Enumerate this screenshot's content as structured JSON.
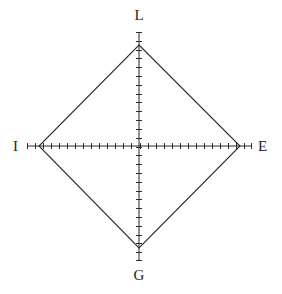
{
  "figure": {
    "name": "diamond-axes-plot",
    "background_color": "#ffffff",
    "line_color": "#2b2b2b",
    "label_color": "#1d1d1d"
  },
  "labels": {
    "top": "L",
    "right": "E",
    "bottom": "G",
    "left": "I"
  },
  "chart_data": {
    "type": "line",
    "title": "",
    "subtitle": "",
    "xlabel": "",
    "ylabel": "",
    "grid": false,
    "legend": "none",
    "axes": [
      {
        "name": "L",
        "direction": "up",
        "angle_deg": 90,
        "value": 1.0,
        "axis_length": 1.08
      },
      {
        "name": "E",
        "direction": "right",
        "angle_deg": 0,
        "value": 1.0,
        "axis_length": 1.12
      },
      {
        "name": "G",
        "direction": "down",
        "angle_deg": 270,
        "value": 1.0,
        "axis_length": 1.08
      },
      {
        "name": "I",
        "direction": "left",
        "angle_deg": 180,
        "value": 1.0,
        "axis_length": 1.12
      }
    ],
    "categories": [
      "L",
      "E",
      "G",
      "I"
    ],
    "values": [
      1.0,
      1.0,
      1.0,
      1.0
    ],
    "ylim": [
      0,
      1.12
    ],
    "center_px": {
      "x": 139,
      "y": 146
    },
    "vertices_px": [
      {
        "label": "L",
        "x": 139,
        "y": 45
      },
      {
        "label": "E",
        "x": 240,
        "y": 146
      },
      {
        "label": "G",
        "x": 139,
        "y": 248
      },
      {
        "label": "I",
        "x": 39,
        "y": 146
      }
    ],
    "axis_endpoints_px": {
      "top": {
        "x": 139,
        "y": 32
      },
      "right": {
        "x": 252,
        "y": 146
      },
      "bottom": {
        "x": 139,
        "y": 261
      },
      "left": {
        "x": 27,
        "y": 146
      }
    },
    "ticks": {
      "horizontal_count": 28,
      "vertical_count": 26,
      "tick_length_px": 3,
      "end_cap_length_px": 6
    }
  }
}
